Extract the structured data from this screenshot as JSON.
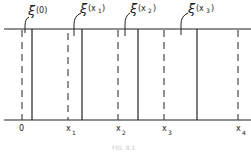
{
  "figure": {
    "caption": "FIG. 8.1",
    "top_labels": [
      {
        "text": "ξ",
        "arg": "(0)",
        "sub": ""
      },
      {
        "text": "ξ",
        "arg": "(x",
        "sub": "1",
        "close": ")"
      },
      {
        "text": "ξ",
        "arg": "(x",
        "sub": "2",
        "close": ")"
      },
      {
        "text": "ξ",
        "arg": "(x",
        "sub": "3",
        "close": ")"
      }
    ],
    "bottom_labels": [
      {
        "text": "0",
        "sub": ""
      },
      {
        "text": "x",
        "sub": "1"
      },
      {
        "text": "x",
        "sub": "2"
      },
      {
        "text": "x",
        "sub": "3"
      },
      {
        "text": "x",
        "sub": "4"
      }
    ],
    "line_color": "#222222"
  }
}
